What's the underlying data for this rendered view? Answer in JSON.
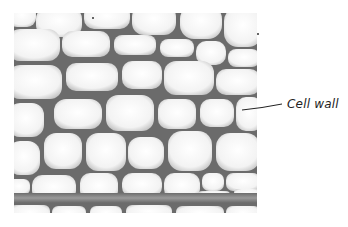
{
  "figure": {
    "labels": [
      {
        "text": "Cell wall",
        "target": "cell wall between cells"
      }
    ]
  },
  "colors": {
    "background": "#ffffff",
    "wall": "#5f5f5f",
    "cell_fill": "#f4f4f4",
    "label_text": "#222222"
  }
}
